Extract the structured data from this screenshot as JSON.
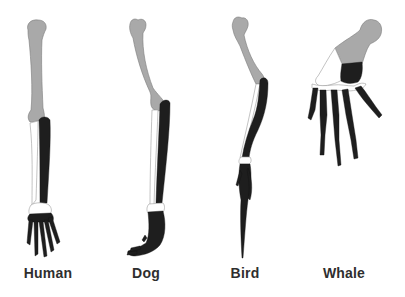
{
  "diagram": {
    "limbs": [
      {
        "id": "human",
        "label": "Human"
      },
      {
        "id": "dog",
        "label": "Dog"
      },
      {
        "id": "bird",
        "label": "Bird"
      },
      {
        "id": "whale",
        "label": "Whale"
      }
    ],
    "bone_colors": {
      "humerus": "#a9a9a9",
      "radius": "#ffffff",
      "ulna": "#1e1e1e",
      "carpals": "#ffffff",
      "metacarpals_phalanges": "#1e1e1e"
    },
    "label_color": "#2e2e2e",
    "background": "#ffffff"
  }
}
